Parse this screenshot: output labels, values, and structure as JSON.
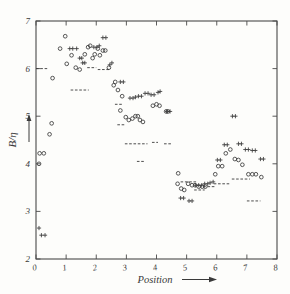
{
  "figure": {
    "background_color": "#fdfdfb",
    "ink_color": "#3a3a3a",
    "frame_color": "#4a4a4a"
  },
  "labels": {
    "ylabel": "B/η",
    "xlabel": "Position",
    "xlabel_arrow": "⟶",
    "ylabel_arrow": "↑"
  },
  "chart_data": {
    "type": "scatter",
    "title": "",
    "xlabel": "Position",
    "ylabel": "B/η",
    "xlim": [
      0,
      8
    ],
    "ylim": [
      2,
      7
    ],
    "xticks": [
      0,
      1,
      2,
      3,
      4,
      5,
      6,
      7,
      8
    ],
    "xtick_labels": [
      "0",
      "1",
      "2",
      "3",
      "4",
      "5",
      "6",
      "7",
      "8"
    ],
    "yticks": [
      2,
      3,
      4,
      5,
      6,
      7
    ],
    "ytick_labels": [
      "2",
      "3",
      "4",
      "5",
      "6",
      "7"
    ],
    "grid": false,
    "legend": "none",
    "series": [
      {
        "name": "circle-series",
        "marker": "circle",
        "points": [
          [
            0.1,
            4.0
          ],
          [
            0.12,
            4.22
          ],
          [
            0.26,
            4.22
          ],
          [
            0.45,
            4.62
          ],
          [
            0.52,
            4.85
          ],
          [
            0.55,
            5.8
          ],
          [
            0.8,
            6.42
          ],
          [
            0.97,
            6.68
          ],
          [
            1.02,
            6.1
          ],
          [
            1.18,
            6.28
          ],
          [
            1.32,
            6.02
          ],
          [
            1.45,
            5.98
          ],
          [
            1.62,
            6.3
          ],
          [
            1.73,
            6.45
          ],
          [
            1.8,
            6.48
          ],
          [
            1.88,
            6.22
          ],
          [
            1.95,
            6.3
          ],
          [
            2.05,
            6.42
          ],
          [
            2.12,
            6.28
          ],
          [
            2.22,
            6.38
          ],
          [
            2.3,
            6.38
          ],
          [
            2.42,
            6.02
          ],
          [
            2.63,
            5.72
          ],
          [
            2.58,
            5.65
          ],
          [
            2.72,
            5.55
          ],
          [
            2.8,
            5.12
          ],
          [
            2.86,
            5.42
          ],
          [
            2.98,
            4.98
          ],
          [
            3.08,
            4.92
          ],
          [
            3.2,
            4.95
          ],
          [
            3.3,
            5.0
          ],
          [
            3.38,
            5.0
          ],
          [
            3.45,
            4.92
          ],
          [
            3.55,
            4.88
          ],
          [
            3.88,
            5.22
          ],
          [
            4.0,
            5.25
          ],
          [
            4.1,
            5.22
          ],
          [
            4.32,
            5.1
          ],
          [
            4.38,
            5.1
          ],
          [
            4.72,
            3.8
          ],
          [
            4.7,
            3.58
          ],
          [
            4.82,
            3.48
          ],
          [
            4.92,
            3.45
          ],
          [
            5.05,
            3.58
          ],
          [
            5.18,
            3.55
          ],
          [
            5.28,
            3.55
          ],
          [
            5.4,
            3.52
          ],
          [
            5.52,
            3.52
          ],
          [
            5.62,
            3.52
          ],
          [
            5.95,
            3.78
          ],
          [
            6.05,
            3.95
          ],
          [
            6.18,
            3.95
          ],
          [
            6.3,
            4.22
          ],
          [
            6.45,
            4.3
          ],
          [
            6.6,
            4.1
          ],
          [
            6.72,
            4.08
          ],
          [
            6.85,
            3.98
          ],
          [
            7.05,
            3.78
          ],
          [
            7.18,
            3.78
          ],
          [
            7.3,
            3.78
          ],
          [
            7.48,
            3.72
          ]
        ]
      },
      {
        "name": "plus-series",
        "marker": "plus",
        "points": [
          [
            0.1,
            2.65
          ],
          [
            0.18,
            2.5
          ],
          [
            0.3,
            2.5
          ],
          [
            1.12,
            6.42
          ],
          [
            1.22,
            6.42
          ],
          [
            1.35,
            6.42
          ],
          [
            1.45,
            6.22
          ],
          [
            1.52,
            6.22
          ],
          [
            1.55,
            6.12
          ],
          [
            1.62,
            6.12
          ],
          [
            1.92,
            6.45
          ],
          [
            2.02,
            6.45
          ],
          [
            2.1,
            6.48
          ],
          [
            2.22,
            6.65
          ],
          [
            2.32,
            6.65
          ],
          [
            2.45,
            6.08
          ],
          [
            2.52,
            6.12
          ],
          [
            2.8,
            5.72
          ],
          [
            2.9,
            5.72
          ],
          [
            3.12,
            5.38
          ],
          [
            3.22,
            5.38
          ],
          [
            3.3,
            5.4
          ],
          [
            3.4,
            5.42
          ],
          [
            3.5,
            5.42
          ],
          [
            3.62,
            5.48
          ],
          [
            3.72,
            5.48
          ],
          [
            3.82,
            5.45
          ],
          [
            3.92,
            5.45
          ],
          [
            4.05,
            5.5
          ],
          [
            4.12,
            5.52
          ],
          [
            4.35,
            5.1
          ],
          [
            4.45,
            5.1
          ],
          [
            4.8,
            3.28
          ],
          [
            4.9,
            3.28
          ],
          [
            5.08,
            3.22
          ],
          [
            5.18,
            3.22
          ],
          [
            5.3,
            3.55
          ],
          [
            5.4,
            3.55
          ],
          [
            5.5,
            3.55
          ],
          [
            5.6,
            3.58
          ],
          [
            5.7,
            3.58
          ],
          [
            5.78,
            3.6
          ],
          [
            5.88,
            3.62
          ],
          [
            6.02,
            4.08
          ],
          [
            6.12,
            4.08
          ],
          [
            6.25,
            4.4
          ],
          [
            6.35,
            4.4
          ],
          [
            6.52,
            5.0
          ],
          [
            6.62,
            5.0
          ],
          [
            6.72,
            4.42
          ],
          [
            6.82,
            4.42
          ],
          [
            6.95,
            4.3
          ],
          [
            7.05,
            4.3
          ],
          [
            7.18,
            4.28
          ],
          [
            7.28,
            4.28
          ],
          [
            7.45,
            4.1
          ],
          [
            7.55,
            4.1
          ]
        ]
      }
    ],
    "step_segments": [
      {
        "x0": 0.0,
        "x1": 0.42,
        "y": 6.0
      },
      {
        "x0": 1.15,
        "x1": 1.75,
        "y": 5.55
      },
      {
        "x0": 1.7,
        "x1": 2.0,
        "y": 6.02
      },
      {
        "x0": 2.05,
        "x1": 2.45,
        "y": 5.98
      },
      {
        "x0": 2.62,
        "x1": 2.88,
        "y": 5.25
      },
      {
        "x0": 2.7,
        "x1": 2.95,
        "y": 4.82
      },
      {
        "x0": 2.95,
        "x1": 3.7,
        "y": 4.42
      },
      {
        "x0": 3.35,
        "x1": 3.6,
        "y": 4.05
      },
      {
        "x0": 3.85,
        "x1": 4.05,
        "y": 4.45
      },
      {
        "x0": 4.25,
        "x1": 4.52,
        "y": 4.42
      },
      {
        "x0": 4.8,
        "x1": 5.35,
        "y": 3.62
      },
      {
        "x0": 5.25,
        "x1": 5.6,
        "y": 3.45
      },
      {
        "x0": 5.55,
        "x1": 5.95,
        "y": 3.52
      },
      {
        "x0": 5.9,
        "x1": 6.45,
        "y": 3.58
      },
      {
        "x0": 6.5,
        "x1": 7.1,
        "y": 3.68
      },
      {
        "x0": 7.0,
        "x1": 7.45,
        "y": 3.22
      }
    ]
  }
}
